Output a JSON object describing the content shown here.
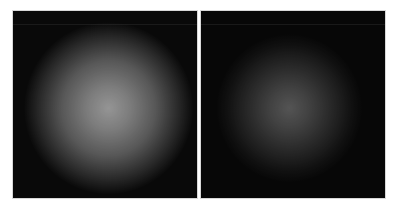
{
  "figure": {
    "panels": [
      {
        "id": "left",
        "description": "bright diffuse radial glow on black background, moderate noise",
        "background_color": "#0b0b0b",
        "glow_center_color": "#b4b4b4",
        "glow_mid_color": "#6e6e6e",
        "glow_center_pct": [
          50,
          50
        ],
        "glow_radius_pct": 45,
        "noise_strength": 0.35
      },
      {
        "id": "right",
        "description": "dim speckled radial glow on black background, strong noise",
        "background_color": "#080808",
        "glow_center_color": "#6a6a6a",
        "glow_mid_color": "#303030",
        "glow_center_pct": [
          50,
          52
        ],
        "glow_radius_pct": 38,
        "noise_strength": 0.6
      }
    ]
  }
}
